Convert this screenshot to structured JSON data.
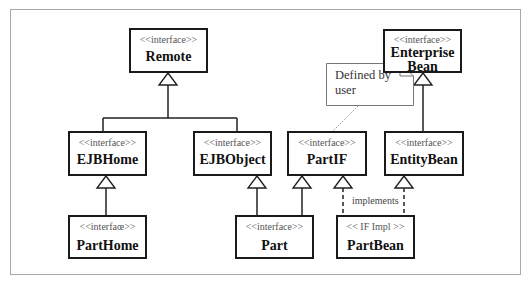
{
  "diagram": {
    "type": "uml-class-diagram",
    "nodes": {
      "remote": {
        "stereotype": "<<interface>>",
        "name": "Remote"
      },
      "enterprise_bean": {
        "stereotype": "<<interface>>",
        "name_line1": "Enterprise",
        "name_line2": "Bean"
      },
      "ejb_home": {
        "stereotype": "<<interface>>",
        "name": "EJBHome"
      },
      "ejb_object": {
        "stereotype": "<<interface>>",
        "name": "EJBObject"
      },
      "part_if": {
        "stereotype": "<<interface>>",
        "name": "PartIF"
      },
      "entity_bean": {
        "stereotype": "<<interface>>",
        "name": "EntityBean"
      },
      "part_home": {
        "stereotype": "<<interfaœ>>",
        "name": "PartHome"
      },
      "part": {
        "stereotype": "<<interface>>",
        "name": "Part"
      },
      "part_bean": {
        "stereotype": "<< IF Impl >>",
        "name": "PartBean"
      }
    },
    "note": {
      "line1": "Defined by",
      "line2": "user",
      "attached_to": "PartIF"
    },
    "edges": [
      {
        "from": "EJBHome",
        "to": "Remote",
        "kind": "generalization"
      },
      {
        "from": "EJBObject",
        "to": "Remote",
        "kind": "generalization"
      },
      {
        "from": "EntityBean",
        "to": "Enterprise Bean",
        "kind": "generalization"
      },
      {
        "from": "PartHome",
        "to": "EJBHome",
        "kind": "generalization"
      },
      {
        "from": "Part",
        "to": "EJBObject",
        "kind": "generalization"
      },
      {
        "from": "Part",
        "to": "PartIF",
        "kind": "generalization"
      },
      {
        "from": "PartBean",
        "to": "PartIF",
        "kind": "realization"
      },
      {
        "from": "PartBean",
        "to": "EntityBean",
        "kind": "realization"
      }
    ],
    "edge_label": "implements"
  }
}
